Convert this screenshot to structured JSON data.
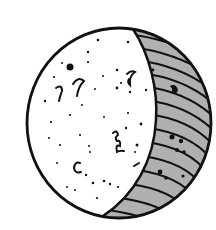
{
  "figure": {
    "phase": "waxing-gibbous",
    "colors": {
      "background": "#ffffff",
      "outline": "#111111",
      "lit": "#ffffff",
      "shadow": "#b0b0b0"
    }
  }
}
